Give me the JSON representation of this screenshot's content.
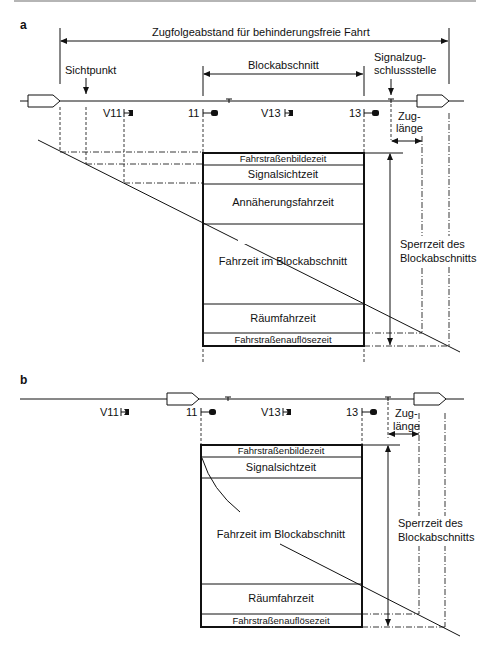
{
  "panels": {
    "a": {
      "label": "a",
      "headway_label": "Zugfolgeabstand für behinderungsfreie Fahrt",
      "sight_point_label": "Sichtpunkt",
      "block_section_label": "Blockabschnitt",
      "clearing_point_label_1": "Signalzug-",
      "clearing_point_label_2": "schlussstelle",
      "signals": [
        "V11",
        "11",
        "V13",
        "13"
      ],
      "train_length_label_1": "Zug-",
      "train_length_label_2": "länge",
      "blocking_time_label_1": "Sperrzeit des",
      "blocking_time_label_2": "Blockabschnitts",
      "blocks": [
        "Fahrstraßenbildezeit",
        "Signalsichtzeit",
        "Annäherungsfahrzeit",
        "Fahrzeit im Blockabschnitt",
        "Räumfahrzeit",
        "Fahrstraßenauflösezeit"
      ]
    },
    "b": {
      "label": "b",
      "signals": [
        "V11",
        "11",
        "V13",
        "13"
      ],
      "train_length_label_1": "Zug-",
      "train_length_label_2": "länge",
      "blocking_time_label_1": "Sperrzeit des",
      "blocking_time_label_2": "Blockabschnitts",
      "blocks": [
        "Fahrstraßenbildezeit",
        "Signalsichtzeit",
        "Fahrzeit im Blockabschnitt",
        "Räumfahrzeit",
        "Fahrstraßenauflösezeit"
      ]
    }
  }
}
